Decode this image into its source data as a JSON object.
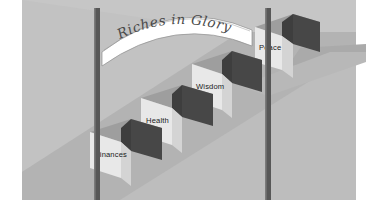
{
  "image": {
    "width": 374,
    "height": 217,
    "background_color": "#ffffff",
    "title": "Riches in Glory staircase illustration",
    "style": "grayscale isometric clip-art"
  },
  "banner": {
    "name": "ribbon-banner",
    "text": "Riches in Glory",
    "fill_color": "#ffffff",
    "outline_color": "#8a8a8a",
    "text_color": "#4a4a4a"
  },
  "poles": [
    {
      "name": "left-pole",
      "color": "#5a5a5a",
      "x": 97
    },
    {
      "name": "right-pole",
      "color": "#5a5a5a",
      "x": 268
    }
  ],
  "floor": {
    "name": "floor-plane",
    "color": "#bdbdbd",
    "ramp_color": "#a8a8a8",
    "shadow_color": "#b0b0b0"
  },
  "steps": [
    {
      "label": "Finances",
      "order": 1,
      "front_color": "#e6e6e6",
      "top_color": "#9a9a9a",
      "side_color": "#d2d2d2",
      "wedge_color": "#4a4a4a"
    },
    {
      "label": "Health",
      "order": 2,
      "front_color": "#e6e6e6",
      "top_color": "#9a9a9a",
      "side_color": "#d2d2d2",
      "wedge_color": "#4a4a4a"
    },
    {
      "label": "Wisdom",
      "order": 3,
      "front_color": "#e6e6e6",
      "top_color": "#9a9a9a",
      "side_color": "#d2d2d2",
      "wedge_color": "#4a4a4a"
    },
    {
      "label": "Peace",
      "order": 4,
      "front_color": "#e6e6e6",
      "top_color": "#9a9a9a",
      "side_color": "#d2d2d2",
      "wedge_color": "#4a4a4a"
    }
  ]
}
